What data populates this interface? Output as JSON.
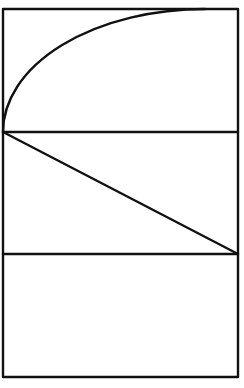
{
  "diagram": {
    "sections": [
      {
        "name": "top",
        "content": "arc"
      },
      {
        "name": "middle",
        "content": "diagonal"
      },
      {
        "name": "bottom",
        "content": "empty"
      }
    ],
    "stroke_color": "#111111",
    "background_color": "#ffffff"
  }
}
